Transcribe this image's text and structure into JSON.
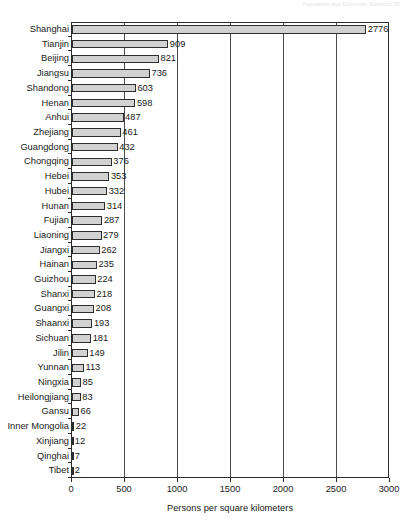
{
  "page_header": "Population and Economic Statistics    55",
  "chart_data": {
    "type": "bar",
    "orientation": "horizontal",
    "title": "",
    "xlabel": "Persons per square kilometers",
    "ylabel": "",
    "xlim": [
      0,
      3000
    ],
    "xticks": [
      0,
      500,
      1000,
      1500,
      2000,
      2500,
      3000
    ],
    "xtick_labels": [
      "0",
      "500",
      "1000",
      "1500",
      "2000",
      "2500",
      "3000"
    ],
    "grid": true,
    "grid_axis": "x",
    "legend": null,
    "bar_color": "#d2d2d2",
    "bar_edge_color": "#2e2e2e",
    "categories": [
      "Shanghai",
      "Tianjin",
      "Beijing",
      "Jiangsu",
      "Shandong",
      "Henan",
      "Anhui",
      "Zhejiang",
      "Guangdong",
      "Chongqing",
      "Hebei",
      "Hubei",
      "Hunan",
      "Fujian",
      "Liaoning",
      "Jiangxi",
      "Hainan",
      "Guizhou",
      "Shanxi",
      "Guangxi",
      "Shaanxi",
      "Sichuan",
      "Jilin",
      "Yunnan",
      "Ningxia",
      "Heilongjiang",
      "Gansu",
      "Inner Mongolia",
      "Xinjiang",
      "Qinghai",
      "Tibet"
    ],
    "values": [
      2776,
      909,
      821,
      736,
      603,
      598,
      487,
      461,
      432,
      376,
      353,
      332,
      314,
      287,
      279,
      262,
      235,
      224,
      218,
      208,
      193,
      181,
      149,
      113,
      85,
      83,
      66,
      22,
      12,
      7,
      2
    ],
    "value_labels": [
      "2776",
      "909",
      "821",
      "736",
      "603",
      "598",
      "487",
      "461",
      "432",
      "376",
      "353",
      "332",
      "314",
      "287",
      "279",
      "262",
      "235",
      "224",
      "218",
      "208",
      "193",
      "181",
      "149",
      "113",
      "85",
      "83",
      "66",
      "22",
      "12",
      "7",
      "2"
    ]
  }
}
